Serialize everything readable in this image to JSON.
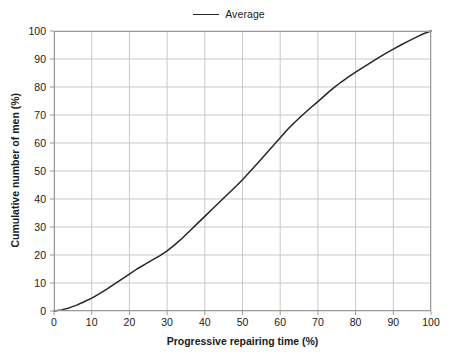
{
  "chart_data": {
    "type": "line",
    "title": "",
    "subtitle": "",
    "xlabel": "Progressive repairing time (%)",
    "ylabel": "Cumulative number of men (%)",
    "xlim": [
      0,
      100
    ],
    "ylim": [
      0,
      100
    ],
    "xticks": [
      0,
      10,
      20,
      30,
      40,
      50,
      60,
      70,
      80,
      90,
      100
    ],
    "yticks": [
      0,
      10,
      20,
      30,
      40,
      50,
      60,
      70,
      80,
      90,
      100
    ],
    "grid": true,
    "legend_position": "top-center",
    "series": [
      {
        "name": "Average",
        "color": "#262626",
        "x": [
          0,
          2,
          4,
          6,
          8,
          10,
          12,
          14,
          16,
          18,
          20,
          22,
          24,
          26,
          28,
          30,
          32,
          34,
          36,
          38,
          40,
          42,
          44,
          46,
          48,
          50,
          52,
          54,
          56,
          58,
          60,
          62,
          64,
          66,
          68,
          70,
          72,
          74,
          76,
          78,
          80,
          82,
          84,
          86,
          88,
          90,
          92,
          94,
          96,
          98,
          100
        ],
        "values": [
          0,
          0.4,
          1.1,
          2.1,
          3.3,
          4.6,
          6.1,
          7.8,
          9.6,
          11.4,
          13.2,
          15.0,
          16.6,
          18.2,
          19.7,
          21.5,
          23.6,
          26.0,
          28.6,
          31.2,
          33.8,
          36.4,
          39.0,
          41.6,
          44.2,
          46.9,
          49.8,
          52.8,
          55.8,
          58.8,
          61.9,
          64.9,
          67.6,
          70.1,
          72.5,
          74.8,
          77.2,
          79.5,
          81.6,
          83.5,
          85.3,
          87.0,
          88.7,
          90.4,
          92.0,
          93.5,
          95.0,
          96.4,
          97.7,
          99.0,
          100.0
        ]
      }
    ],
    "annotations": []
  },
  "legend": {
    "entries": [
      {
        "label": "Average",
        "color": "#262626"
      }
    ]
  },
  "axes": {
    "x": {
      "title": "Progressive repairing time (%)",
      "tick_labels": [
        "0",
        "10",
        "20",
        "30",
        "40",
        "50",
        "60",
        "70",
        "80",
        "90",
        "100"
      ]
    },
    "y": {
      "title": "Cumulative number of men (%)",
      "tick_labels": [
        "0",
        "10",
        "20",
        "30",
        "40",
        "50",
        "60",
        "70",
        "80",
        "90",
        "100"
      ]
    }
  },
  "style": {
    "grid_color": "#c9c9c9",
    "frame_color": "#9a9a9a",
    "series_color": "#262626",
    "background": "#ffffff",
    "text_color": "#1a1a1a"
  }
}
